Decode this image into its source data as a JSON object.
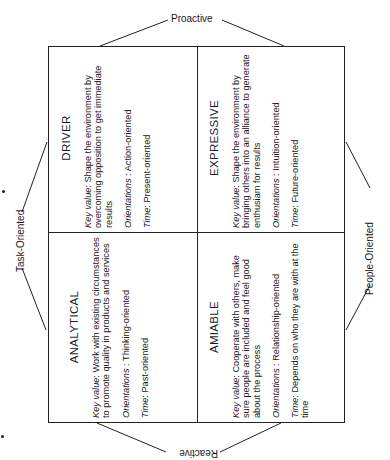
{
  "axes": {
    "top": "Proactive",
    "bottom": "Reactive",
    "left": "Task-Oriented",
    "right": "People-Oriented"
  },
  "quadrants": [
    {
      "position": "top-left",
      "title": "DRIVER",
      "key_value_label": "Key value",
      "key_value": ": Shape the environment by overcoming opposition to get immediate results",
      "orientations_label": "Orientations",
      "orientations": " : Action-oriented",
      "time_label": "Time",
      "time": ": Present-oriented"
    },
    {
      "position": "top-right",
      "title": "EXPRESSIVE",
      "key_value_label": "Key value",
      "key_value": ": Shape the environment by bringing others into an alliance to generate enthusiam for results",
      "orientations_label": "Orientations",
      "orientations": " : Intuition-oriented",
      "time_label": "Time",
      "time": ": Future-oriented"
    },
    {
      "position": "bottom-left",
      "title": "ANALYTICAL",
      "key_value_label": "Key value",
      "key_value": ": Work with existing circumstances to promote quality in products and services",
      "orientations_label": "Orientations",
      "orientations": " : Thinking-oriented",
      "time_label": "Time",
      "time": ": Past-oriented"
    },
    {
      "position": "bottom-right",
      "title": "AMIABLE",
      "key_value_label": "Key value",
      "key_value": ": Cooperate with others, make sure people are included and feel good about the process",
      "orientations_label": "Orientations",
      "orientations": " : Relationship-oriented",
      "time_label": "Time",
      "time": ": Depends on who they are with at the time"
    }
  ]
}
